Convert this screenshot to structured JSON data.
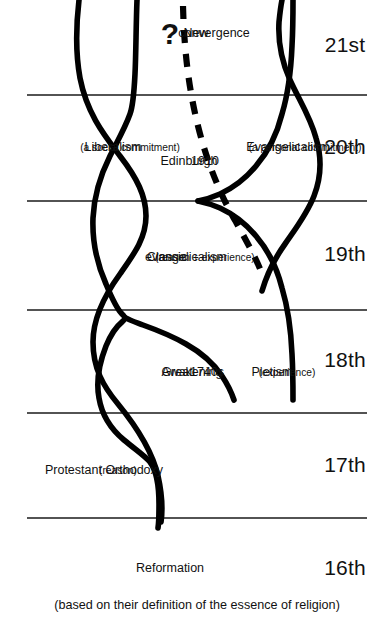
{
  "diagram": {
    "caption": "(based on their definition of the essence of religion)",
    "centuries": [
      {
        "id": "c16",
        "label": "16th"
      },
      {
        "id": "c17",
        "label": "17th"
      },
      {
        "id": "c18",
        "label": "18th"
      },
      {
        "id": "c19",
        "label": "19th"
      },
      {
        "id": "c20",
        "label": "20th"
      },
      {
        "id": "c21",
        "label": "21st"
      }
    ],
    "labels": {
      "reformation": "Reformation",
      "protestant_orthodoxy": "Protestant Orthodoxy",
      "protestant_orthodoxy_sub": "(reason)",
      "great_awakening": "Great",
      "great_awakening_2": "Awakening",
      "great_awakening_3": "1740s",
      "pietism": "Pietism",
      "pietism_sub": "(experience)",
      "classic_evangelicalism": "Classic",
      "classic_evangelicalism_2": "evangelicalism",
      "classic_evangelicalism_sub": "(reason + experience)",
      "liberalism": "Liberalism",
      "liberalism_sub": "(a social commitment)",
      "edinburgh": "Edinburgh",
      "edinburgh_year": "1910",
      "evangelicalism": "Evangelicalism",
      "evangelicalism_sub": "(a personal commitment)",
      "question_mark": "?",
      "new_convergence": "New",
      "new_convergence_2": "convergence"
    },
    "colors": {
      "stroke": "#000000",
      "divider": "#1a1a1a",
      "background": "#ffffff",
      "text": "#111111"
    }
  }
}
